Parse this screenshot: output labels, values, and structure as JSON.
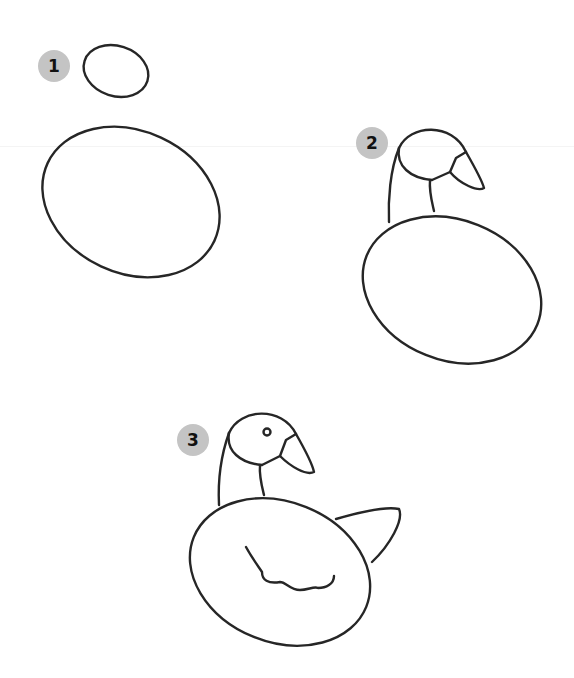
{
  "tutorial": {
    "subject": "goose drawing steps",
    "stroke_color": "#262626",
    "badge_color": "#c4c4c4",
    "steps": [
      {
        "number": "1",
        "badge_x": 38,
        "badge_y": 50
      },
      {
        "number": "2",
        "badge_x": 356,
        "badge_y": 127
      },
      {
        "number": "3",
        "badge_x": 177,
        "badge_y": 424
      }
    ]
  }
}
